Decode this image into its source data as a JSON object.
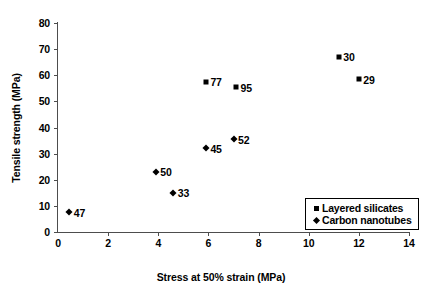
{
  "chart_data": {
    "type": "scatter",
    "title": "",
    "xlabel": "Stress at 50% strain (MPa)",
    "ylabel": "Tensile strength (MPa)",
    "xlim": [
      0,
      14
    ],
    "ylim": [
      0,
      80
    ],
    "xticks": [
      0,
      2,
      4,
      6,
      8,
      10,
      12,
      14
    ],
    "yticks": [
      0,
      10,
      20,
      30,
      40,
      50,
      60,
      70,
      80
    ],
    "xtick_labels": [
      "0",
      "2",
      "4",
      "6",
      "8",
      "10",
      "12",
      "14"
    ],
    "ytick_labels": [
      "0",
      "10",
      "20",
      "30",
      "40",
      "50",
      "60",
      "70",
      "80"
    ],
    "grid": false,
    "legend_position": "lower right",
    "series": [
      {
        "name": "Layered silicates",
        "marker": "square",
        "color": "#000000",
        "points": [
          {
            "label": "77",
            "x": 5.9,
            "y": 57.5
          },
          {
            "label": "95",
            "x": 7.1,
            "y": 55.5
          },
          {
            "label": "30",
            "x": 11.2,
            "y": 67.0
          },
          {
            "label": "29",
            "x": 12.0,
            "y": 58.5
          }
        ]
      },
      {
        "name": "Carbon nanotubes",
        "marker": "diamond",
        "color": "#000000",
        "points": [
          {
            "label": "47",
            "x": 0.45,
            "y": 7.5
          },
          {
            "label": "50",
            "x": 3.9,
            "y": 23.0
          },
          {
            "label": "33",
            "x": 4.6,
            "y": 15.0
          },
          {
            "label": "45",
            "x": 5.9,
            "y": 32.0
          },
          {
            "label": "52",
            "x": 7.0,
            "y": 35.5
          }
        ]
      }
    ]
  },
  "legend": {
    "entries": [
      {
        "marker": "square",
        "label": "Layered silicates"
      },
      {
        "marker": "diamond",
        "label": "Carbon nanotubes"
      }
    ]
  }
}
